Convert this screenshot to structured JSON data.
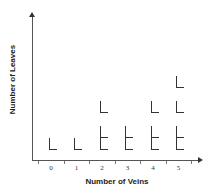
{
  "chart_data": {
    "type": "scatter",
    "subtype": "pictograph-dot-plot",
    "title": "",
    "xlabel": "Number of Veins",
    "ylabel": "Number of Leaves",
    "categories": [
      "0",
      "1",
      "2",
      "3",
      "4",
      "5"
    ],
    "values": [
      1,
      1,
      3,
      2,
      3,
      4
    ],
    "symbol": "L",
    "symbol_meaning": "one leaf",
    "grid": false,
    "legend": null,
    "y_ticks": false,
    "x_ticks": [
      "0",
      "1",
      "2",
      "3",
      "4",
      "5"
    ]
  },
  "axes": {
    "x_title": "Number of Veins",
    "y_title": "Number of Leaves",
    "x_tick_labels": [
      "0",
      "1",
      "2",
      "3",
      "4",
      "5"
    ]
  },
  "colors": {
    "axis": "#555555",
    "mark": "#333333",
    "text": "#222222",
    "background": "#ffffff"
  }
}
